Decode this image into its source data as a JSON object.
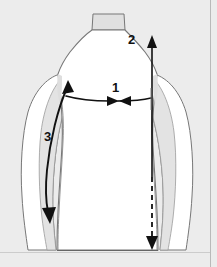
{
  "diagram": {
    "type": "garment-measurement-diagram",
    "background_color": "#ececec",
    "body_fill_color": "#ffffff",
    "shade_fill_color": "#e0e0e0",
    "outline_color": "#666666",
    "marker_color": "#111111",
    "measurements": [
      {
        "id": "1",
        "label": "1",
        "name": "chest-width",
        "orientation": "horizontal",
        "style": "solid double-arrow inward",
        "label_x": 112,
        "label_y": 81
      },
      {
        "id": "2",
        "label": "2",
        "name": "body-length",
        "orientation": "vertical",
        "style": "solid upper with arrow up, dashed lower with arrow down",
        "label_x": 128,
        "label_y": 33
      },
      {
        "id": "3",
        "label": "3",
        "name": "sleeve-length",
        "orientation": "diagonal along left arm",
        "style": "solid double-arrow from shoulder to cuff",
        "label_x": 44,
        "label_y": 130
      }
    ]
  }
}
